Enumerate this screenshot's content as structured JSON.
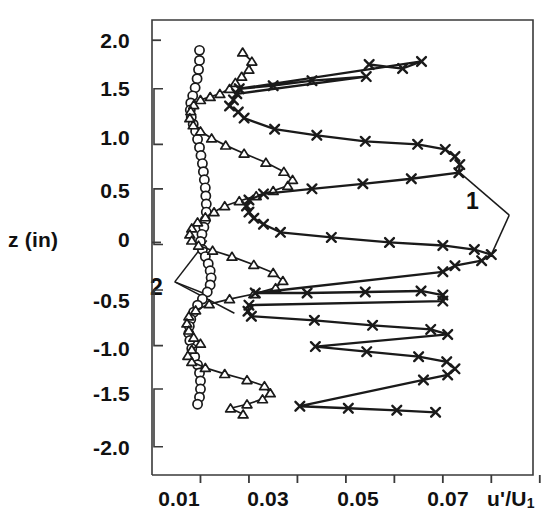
{
  "chart_data": {
    "type": "scatter",
    "title": "",
    "xlabel": "u'/U1",
    "xlabel_display": "u'/U",
    "xlabel_sub": "1",
    "ylabel": "z (in)",
    "xlim": [
      0.0,
      0.0786
    ],
    "ylim": [
      -2.3,
      2.2
    ],
    "grid": false,
    "legend_position": "none",
    "xticks": [
      0.01,
      0.02,
      0.03,
      0.04,
      0.05,
      0.06,
      0.07,
      0.08
    ],
    "xticklabels": [
      "0.01",
      "",
      "0.03",
      "",
      "0.05",
      "",
      "0.07",
      ""
    ],
    "yticks": [
      2.0,
      1.5,
      1.0,
      0.5,
      0,
      -0.5,
      -1.0,
      -1.5,
      -2.0
    ],
    "yticklabels": [
      "2.0",
      "1.5",
      "1.0",
      "0.5",
      "0",
      "-0.5",
      "-1.0",
      "-1.5",
      "-2.0"
    ],
    "annotations": [
      {
        "label": "1",
        "x": 0.0737,
        "y": 0.27,
        "targets": [
          [
            0.0635,
            0.69
          ],
          [
            0.07,
            -0.12
          ]
        ]
      },
      {
        "label": "2",
        "x": 0.0047,
        "y": -0.39,
        "targets": [
          [
            0.0113,
            0.02
          ],
          [
            0.0105,
            -0.5
          ],
          [
            0.017,
            -0.7
          ]
        ]
      }
    ],
    "axis_brackets": [
      {
        "y_top": 1.52,
        "y_bottom": 0.97
      },
      {
        "y_top": 0.53,
        "y_bottom": -0.02
      },
      {
        "y_top": -0.47,
        "y_bottom": -1.02
      },
      {
        "y_top": -1.45,
        "y_bottom": -2.02
      }
    ],
    "series": [
      {
        "name": "circles",
        "marker": "circle",
        "line": true,
        "points": [
          [
            0.0098,
            1.9
          ],
          [
            0.0098,
            1.8
          ],
          [
            0.0096,
            1.71
          ],
          [
            0.0093,
            1.62
          ],
          [
            0.0089,
            1.53
          ],
          [
            0.0084,
            1.45
          ],
          [
            0.008,
            1.38
          ],
          [
            0.0079,
            1.31
          ],
          [
            0.0081,
            1.24
          ],
          [
            0.0085,
            1.17
          ],
          [
            0.009,
            1.1
          ],
          [
            0.0094,
            1.02
          ],
          [
            0.0098,
            0.94
          ],
          [
            0.0101,
            0.86
          ],
          [
            0.0104,
            0.78
          ],
          [
            0.0106,
            0.7
          ],
          [
            0.0108,
            0.62
          ],
          [
            0.011,
            0.54
          ],
          [
            0.0111,
            0.46
          ],
          [
            0.0112,
            0.38
          ],
          [
            0.0112,
            0.3
          ],
          [
            0.011,
            0.22
          ],
          [
            0.0107,
            0.15
          ],
          [
            0.0103,
            0.08
          ],
          [
            0.01,
            0.01
          ],
          [
            0.0104,
            -0.07
          ],
          [
            0.011,
            -0.14
          ],
          [
            0.0116,
            -0.21
          ],
          [
            0.012,
            -0.28
          ],
          [
            0.0122,
            -0.35
          ],
          [
            0.012,
            -0.42
          ],
          [
            0.0114,
            -0.49
          ],
          [
            0.0104,
            -0.56
          ],
          [
            0.0094,
            -0.62
          ],
          [
            0.0086,
            -0.69
          ],
          [
            0.008,
            -0.76
          ],
          [
            0.0077,
            -0.83
          ],
          [
            0.0076,
            -0.9
          ],
          [
            0.0078,
            -0.97
          ],
          [
            0.0082,
            -1.05
          ],
          [
            0.0088,
            -1.13
          ],
          [
            0.0094,
            -1.21
          ],
          [
            0.0098,
            -1.29
          ],
          [
            0.01,
            -1.37
          ],
          [
            0.01,
            -1.45
          ],
          [
            0.0098,
            -1.53
          ],
          [
            0.0094,
            -1.6
          ]
        ]
      },
      {
        "name": "triangles",
        "marker": "triangle",
        "line": true,
        "points": [
          [
            0.0187,
            1.88
          ],
          [
            0.0206,
            1.79
          ],
          [
            0.02,
            1.71
          ],
          [
            0.0185,
            1.64
          ],
          [
            0.0172,
            1.58
          ],
          [
            0.016,
            1.52
          ],
          [
            0.014,
            1.47
          ],
          [
            0.012,
            1.44
          ],
          [
            0.01,
            1.41
          ],
          [
            0.0086,
            1.36
          ],
          [
            0.008,
            1.3
          ],
          [
            0.0078,
            1.23
          ],
          [
            0.0085,
            1.16
          ],
          [
            0.01,
            1.1
          ],
          [
            0.0123,
            1.03
          ],
          [
            0.0152,
            0.96
          ],
          [
            0.019,
            0.88
          ],
          [
            0.0235,
            0.79
          ],
          [
            0.0272,
            0.7
          ],
          [
            0.029,
            0.62
          ],
          [
            0.028,
            0.56
          ],
          [
            0.025,
            0.51
          ],
          [
            0.0215,
            0.46
          ],
          [
            0.018,
            0.41
          ],
          [
            0.015,
            0.36
          ],
          [
            0.0128,
            0.3
          ],
          [
            0.011,
            0.25
          ],
          [
            0.0094,
            0.2
          ],
          [
            0.0082,
            0.14
          ],
          [
            0.0078,
            0.08
          ],
          [
            0.0082,
            0.02
          ],
          [
            0.0096,
            -0.03
          ],
          [
            0.0125,
            -0.08
          ],
          [
            0.0165,
            -0.14
          ],
          [
            0.021,
            -0.22
          ],
          [
            0.025,
            -0.3
          ],
          [
            0.027,
            -0.38
          ],
          [
            0.0255,
            -0.45
          ],
          [
            0.021,
            -0.51
          ],
          [
            0.016,
            -0.56
          ],
          [
            0.0118,
            -0.61
          ],
          [
            0.009,
            -0.67
          ],
          [
            0.0076,
            -0.73
          ],
          [
            0.0072,
            -0.8
          ],
          [
            0.0076,
            -0.87
          ],
          [
            0.0086,
            -0.94
          ],
          [
            0.01,
            -1.0
          ],
          [
            0.0082,
            -1.06
          ],
          [
            0.0074,
            -1.12
          ],
          [
            0.0082,
            -1.18
          ],
          [
            0.011,
            -1.24
          ],
          [
            0.015,
            -1.3
          ],
          [
            0.0196,
            -1.36
          ],
          [
            0.0232,
            -1.42
          ],
          [
            0.0244,
            -1.49
          ],
          [
            0.0228,
            -1.55
          ],
          [
            0.0196,
            -1.6
          ],
          [
            0.0162,
            -1.64
          ],
          [
            0.0188,
            -1.7
          ]
        ]
      },
      {
        "name": "crosses",
        "marker": "x",
        "line": true,
        "points": [
          [
            0.0448,
            1.76
          ],
          [
            0.0517,
            1.72
          ],
          [
            0.0556,
            1.79
          ],
          [
            0.018,
            1.52
          ],
          [
            0.025,
            1.55
          ],
          [
            0.033,
            1.6
          ],
          [
            0.0442,
            1.64
          ],
          [
            0.0175,
            1.47
          ],
          [
            0.0168,
            1.41
          ],
          [
            0.016,
            1.35
          ],
          [
            0.0178,
            1.29
          ],
          [
            0.019,
            1.23
          ],
          [
            0.0253,
            1.12
          ],
          [
            0.034,
            1.06
          ],
          [
            0.044,
            1.0
          ],
          [
            0.0548,
            0.97
          ],
          [
            0.0605,
            0.92
          ],
          [
            0.0625,
            0.85
          ],
          [
            0.0635,
            0.77
          ],
          [
            0.0633,
            0.69
          ],
          [
            0.0535,
            0.63
          ],
          [
            0.0435,
            0.58
          ],
          [
            0.033,
            0.53
          ],
          [
            0.023,
            0.48
          ],
          [
            0.02,
            0.42
          ],
          [
            0.0195,
            0.36
          ],
          [
            0.02,
            0.3
          ],
          [
            0.021,
            0.24
          ],
          [
            0.023,
            0.18
          ],
          [
            0.0265,
            0.1
          ],
          [
            0.037,
            0.05
          ],
          [
            0.049,
            0.0
          ],
          [
            0.06,
            -0.03
          ],
          [
            0.0665,
            -0.07
          ],
          [
            0.07,
            -0.12
          ],
          [
            0.068,
            -0.18
          ],
          [
            0.0625,
            -0.23
          ],
          [
            0.06,
            -0.29
          ],
          [
            0.0213,
            -0.5
          ],
          [
            0.032,
            -0.5
          ],
          [
            0.044,
            -0.49
          ],
          [
            0.0555,
            -0.48
          ],
          [
            0.06,
            -0.52
          ],
          [
            0.06,
            -0.58
          ],
          [
            0.02,
            -0.62
          ],
          [
            0.0198,
            -0.68
          ],
          [
            0.0205,
            -0.73
          ],
          [
            0.0335,
            -0.77
          ],
          [
            0.0455,
            -0.82
          ],
          [
            0.0575,
            -0.86
          ],
          [
            0.061,
            -0.91
          ],
          [
            0.0337,
            -1.03
          ],
          [
            0.0443,
            -1.08
          ],
          [
            0.055,
            -1.13
          ],
          [
            0.0608,
            -1.18
          ],
          [
            0.0625,
            -1.25
          ],
          [
            0.061,
            -1.31
          ],
          [
            0.056,
            -1.36
          ],
          [
            0.0305,
            -1.62
          ],
          [
            0.0405,
            -1.64
          ],
          [
            0.0505,
            -1.66
          ],
          [
            0.0585,
            -1.68
          ]
        ]
      }
    ]
  },
  "axes": {
    "ytick_labels": [
      "2.0",
      "1.5",
      "1.0",
      "0.5",
      "0",
      "-0.5",
      "-1.0",
      "-1.5",
      "-2.0"
    ],
    "xtick_labels": [
      "0.01",
      "0.03",
      "0.05",
      "0.07"
    ],
    "y_axis_name": "z (in)",
    "x_axis_name_main": "u'/U",
    "x_axis_name_sub": "1"
  },
  "annotation_labels": {
    "one": "1",
    "two": "2"
  },
  "colors": {
    "line": "#1a1a1a",
    "marker": "#1a1a1a",
    "axis": "#3a3a3a",
    "background": "#ffffff"
  }
}
